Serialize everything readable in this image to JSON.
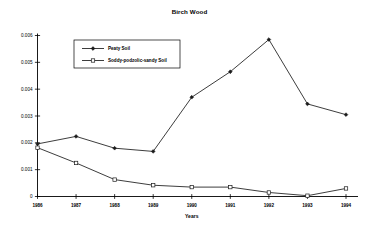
{
  "chart_data": {
    "type": "line",
    "title": "Birch Wood",
    "xlabel": "Years",
    "ylabel": "",
    "categories": [
      "1986",
      "1987",
      "1988",
      "1989",
      "1990",
      "1991",
      "1992",
      "1993",
      "1994"
    ],
    "x": [
      1986,
      1987,
      1988,
      1989,
      1990,
      1991,
      1992,
      1993,
      1994
    ],
    "ylim": [
      0,
      0.006
    ],
    "yticks": [
      0,
      0.001,
      0.002,
      0.003,
      0.004,
      0.005,
      0.006
    ],
    "ytick_labels": [
      "0",
      "0.001",
      "0.002",
      "0.003",
      "0.004",
      "0.005",
      "0.006"
    ],
    "grid": false,
    "legend_position": "upper-left-inside",
    "series": [
      {
        "name": "Peaty Soil",
        "marker": "filled-diamond",
        "color": "#1a1a1a",
        "values": [
          0.00196,
          0.00224,
          0.0018,
          0.00168,
          0.0037,
          0.00465,
          0.00585,
          0.00345,
          0.00305
        ]
      },
      {
        "name": "Soddy-podzolic-sandy Soil",
        "marker": "hollow-square",
        "color": "#1a1a1a",
        "values": [
          0.00182,
          0.00125,
          0.00063,
          0.00042,
          0.00035,
          0.00035,
          0.00015,
          3e-05,
          0.0003
        ]
      }
    ]
  }
}
